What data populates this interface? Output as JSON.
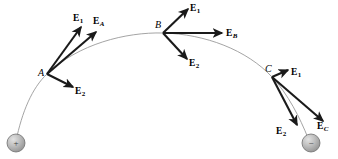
{
  "figure": {
    "background_color": "#ffffff",
    "width": 338,
    "height": 159
  },
  "colors": {
    "field_line": "#9a9a9a",
    "vector": "#1a1a1a",
    "charge_fill": "#b4b4b4",
    "charge_stroke": "#6e6e6e",
    "text": "#000000"
  },
  "field_line": {
    "name": "field-line",
    "path": "M 16,141 C 22,112 32,88 47,74 C 78,44 126,32 163,33 C 205,34 247,50 272,77 C 288,94 300,118 308,138"
  },
  "charges": [
    {
      "id": "positive-charge",
      "label": "+",
      "cx": 16,
      "cy": 143,
      "r": 9
    },
    {
      "id": "negative-charge",
      "label": "−",
      "cx": 311,
      "cy": 143,
      "r": 9
    }
  ],
  "points": [
    {
      "id": "point-a",
      "label": "A",
      "x": 47,
      "y": 74,
      "label_x": 38,
      "label_y": 68
    },
    {
      "id": "point-b",
      "label": "B",
      "x": 163,
      "y": 33,
      "label_x": 155,
      "label_y": 20
    },
    {
      "id": "point-c",
      "label": "C",
      "x": 272,
      "y": 77,
      "label_x": 265,
      "label_y": 64
    }
  ],
  "vectors": [
    {
      "id": "vector-a-e1",
      "at_point": "A",
      "base": "E",
      "subscript": "1",
      "subscript_style": "number",
      "x1": 47,
      "y1": 74,
      "x2": 81,
      "y2": 27,
      "label_x": 73,
      "label_y": 14
    },
    {
      "id": "vector-a-ea",
      "at_point": "A",
      "base": "E",
      "subscript": "A",
      "subscript_style": "italic",
      "x1": 47,
      "y1": 74,
      "x2": 96,
      "y2": 32,
      "label_x": 93,
      "label_y": 17
    },
    {
      "id": "vector-a-e2",
      "at_point": "A",
      "base": "E",
      "subscript": "2",
      "subscript_style": "number",
      "x1": 47,
      "y1": 74,
      "x2": 73,
      "y2": 87,
      "label_x": 75,
      "label_y": 87
    },
    {
      "id": "vector-b-e1",
      "at_point": "B",
      "base": "E",
      "subscript": "1",
      "subscript_style": "number",
      "x1": 163,
      "y1": 33,
      "x2": 188,
      "y2": 9,
      "label_x": 190,
      "label_y": 4
    },
    {
      "id": "vector-b-eb",
      "at_point": "B",
      "base": "E",
      "subscript": "B",
      "subscript_style": "italic",
      "x1": 163,
      "y1": 33,
      "x2": 222,
      "y2": 33,
      "label_x": 226,
      "label_y": 29
    },
    {
      "id": "vector-b-e2",
      "at_point": "B",
      "base": "E",
      "subscript": "2",
      "subscript_style": "number",
      "x1": 163,
      "y1": 33,
      "x2": 187,
      "y2": 59,
      "label_x": 189,
      "label_y": 59
    },
    {
      "id": "vector-c-e1",
      "at_point": "C",
      "base": "E",
      "subscript": "1",
      "subscript_style": "number",
      "x1": 272,
      "y1": 77,
      "x2": 288,
      "y2": 70,
      "label_x": 291,
      "label_y": 68
    },
    {
      "id": "vector-c-e2",
      "at_point": "C",
      "base": "E",
      "subscript": "2",
      "subscript_style": "number",
      "x1": 272,
      "y1": 77,
      "x2": 297,
      "y2": 125,
      "label_x": 276,
      "label_y": 127
    },
    {
      "id": "vector-c-ec",
      "at_point": "C",
      "base": "E",
      "subscript": "C",
      "subscript_style": "italic",
      "x1": 272,
      "y1": 77,
      "x2": 323,
      "y2": 121,
      "label_x": 317,
      "label_y": 122
    }
  ]
}
